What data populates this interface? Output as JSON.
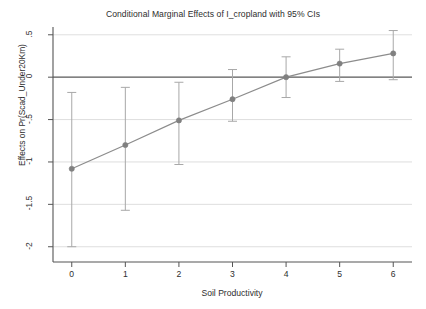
{
  "chart_data": {
    "type": "line",
    "title": "Conditional Marginal Effects of I_cropland with 95% CIs",
    "subtitle": "",
    "xlabel": "Soil Productivity",
    "ylabel": "Effects on Pr(Scad_Under20Km)",
    "x": [
      0,
      1,
      2,
      3,
      4,
      5,
      6
    ],
    "values": [
      -1.08,
      -0.8,
      -0.51,
      -0.26,
      0.0,
      0.16,
      0.28
    ],
    "ci_lower": [
      -2.0,
      -1.57,
      -1.03,
      -0.52,
      -0.24,
      -0.05,
      -0.03
    ],
    "ci_upper": [
      -0.18,
      -0.12,
      -0.06,
      0.09,
      0.24,
      0.33,
      0.55
    ],
    "series": [
      {
        "name": "Conditional marginal effect",
        "values": [
          -1.08,
          -0.8,
          -0.51,
          -0.26,
          0.0,
          0.16,
          0.28
        ]
      }
    ],
    "xlim": [
      -0.35,
      6.35
    ],
    "ylim": [
      -2.18,
      0.58
    ],
    "xticks": [
      0,
      1,
      2,
      3,
      4,
      5,
      6
    ],
    "xtick_labels": [
      "0",
      "1",
      "2",
      "3",
      "4",
      "5",
      "6"
    ],
    "yticks": [
      0.5,
      0,
      -0.5,
      -1,
      -1.5,
      -2
    ],
    "ytick_labels": [
      ".5",
      "0",
      "-.5",
      "-1",
      "-1.5",
      "-2"
    ],
    "grid": "horizontal",
    "zero_line": 0,
    "legend": "none",
    "marker": "circle",
    "colors": {
      "line": "#8c8c8c",
      "marker": "#808080",
      "error_bar": "#a8a8a8",
      "grid": "#d6d6d6",
      "axis": "#555555",
      "zero_line": "#595959",
      "background": "#ffffff"
    }
  }
}
